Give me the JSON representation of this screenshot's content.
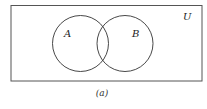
{
  "diagram": {
    "type": "venn",
    "universe": {
      "label": "U"
    },
    "sets": [
      {
        "label": "A"
      },
      {
        "label": "B"
      }
    ],
    "caption": "(a)",
    "colors": {
      "stroke": "#333333",
      "background": "#ffffff"
    }
  }
}
